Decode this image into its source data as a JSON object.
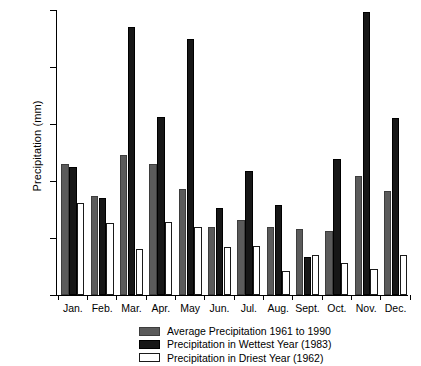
{
  "chart_data": {
    "type": "bar",
    "title": "",
    "xlabel": "",
    "ylabel": "Precipitation (mm)",
    "ylim": [
      0,
      250
    ],
    "yticks": [
      0,
      50,
      100,
      150,
      200,
      250
    ],
    "grid": false,
    "legend_position": "bottom",
    "categories": [
      "Jan.",
      "Feb.",
      "Mar.",
      "Apr.",
      "May",
      "Jun.",
      "Jul.",
      "Aug.",
      "Sept.",
      "Oct.",
      "Nov.",
      "Dec."
    ],
    "series": [
      {
        "name": "Average Precipitation 1961 to 1990",
        "key": "avg",
        "color": "#5b5b5b",
        "values": [
          115,
          87,
          123,
          115,
          93,
          60,
          66,
          60,
          58,
          56,
          104,
          91
        ]
      },
      {
        "name": "Precipitation in Wettest Year (1983)",
        "key": "wet",
        "color": "#171717",
        "values": [
          112,
          85,
          235,
          156,
          225,
          76,
          109,
          79,
          33,
          119,
          248,
          155
        ]
      },
      {
        "name": "Precipitation in Driest Year (1962)",
        "key": "dry",
        "color": "#ffffff",
        "values": [
          81,
          63,
          40,
          64,
          60,
          42,
          43,
          21,
          35,
          28,
          23,
          35
        ]
      }
    ]
  },
  "axis": {
    "y_title": "Precipitation (mm)",
    "y_tick_labels": [
      "0",
      "50",
      "100",
      "150",
      "200",
      "250"
    ],
    "x_tick_labels": [
      "Jan.",
      "Feb.",
      "Mar.",
      "Apr.",
      "May",
      "Jun.",
      "Jul.",
      "Aug.",
      "Sept.",
      "Oct.",
      "Nov.",
      "Dec."
    ]
  },
  "legend": {
    "entries": [
      {
        "label": "Average Precipitation 1961 to 1990",
        "swatch": "avg"
      },
      {
        "label": "Precipitation in Wettest Year (1983)",
        "swatch": "wet"
      },
      {
        "label": "Precipitation in Driest Year (1962)",
        "swatch": "dry"
      }
    ]
  }
}
